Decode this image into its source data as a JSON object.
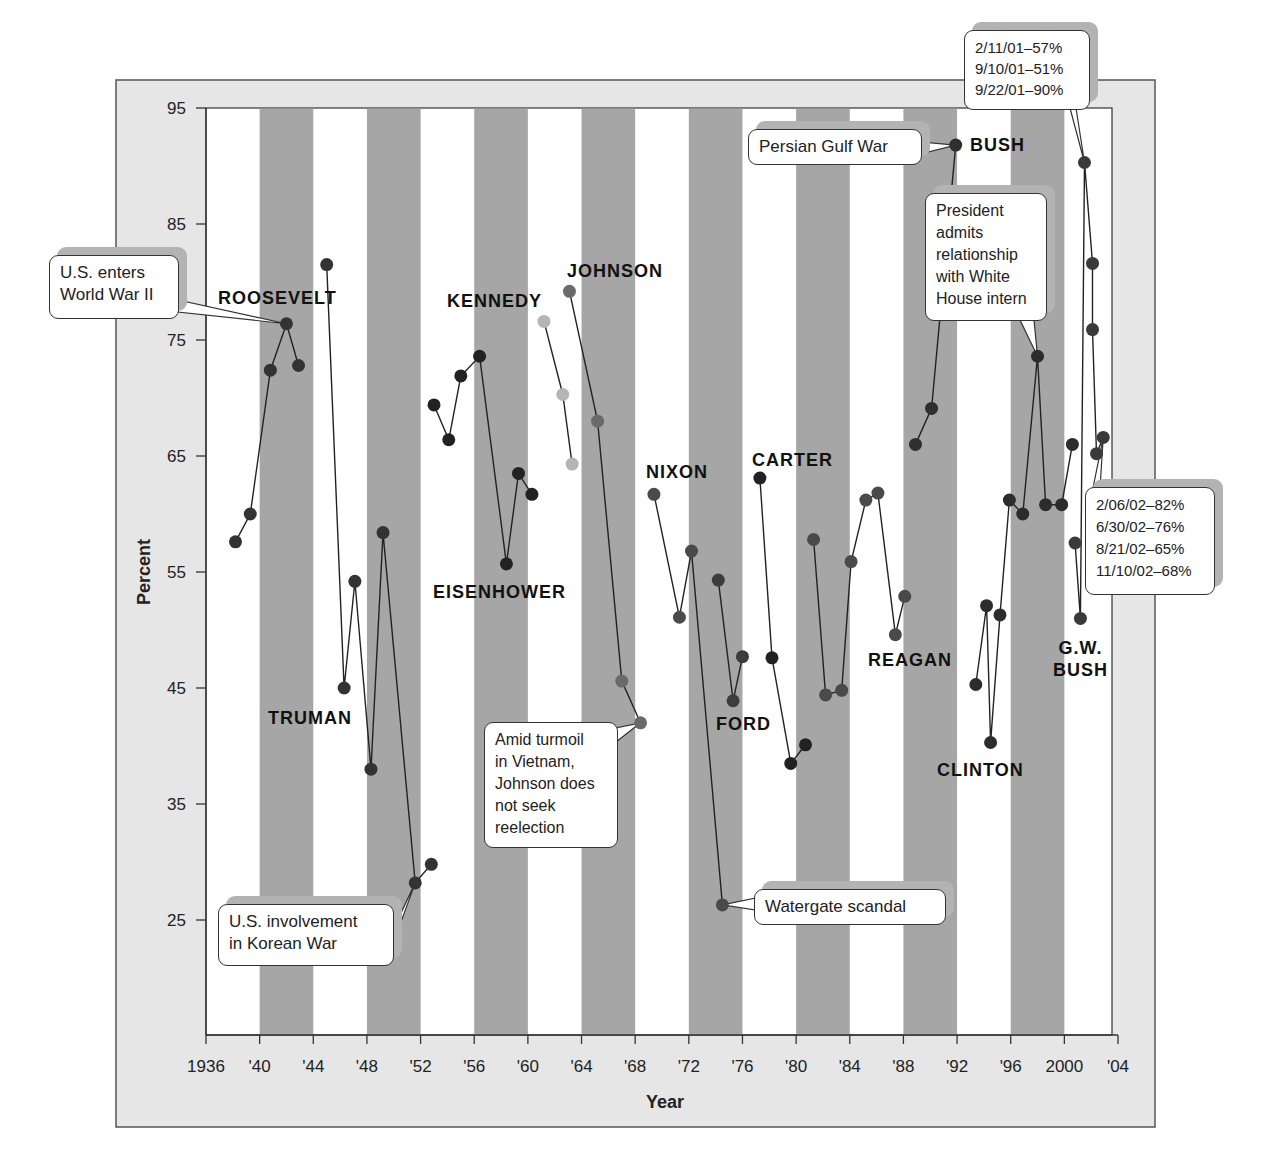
{
  "chart_data": {
    "type": "line",
    "title": "",
    "xlabel": "Year",
    "ylabel": "Percent",
    "xlim": [
      1936,
      2004
    ],
    "ylim": [
      15,
      95
    ],
    "x_ticks": [
      1936,
      1940,
      1944,
      1948,
      1952,
      1956,
      1960,
      1964,
      1968,
      1972,
      1976,
      1980,
      1984,
      1988,
      1992,
      1996,
      2000,
      2004
    ],
    "x_tick_labels": [
      "1936",
      "'40",
      "'44",
      "'48",
      "'52",
      "'56",
      "'60",
      "'64",
      "'68",
      "'72",
      "'76",
      "'80",
      "'84",
      "'88",
      "'92",
      "'96",
      "2000",
      "'04"
    ],
    "y_ticks": [
      25,
      35,
      45,
      55,
      65,
      75,
      85,
      95
    ],
    "y_tick_labels": [
      "25",
      "35",
      "45",
      "55",
      "65",
      "75",
      "85",
      "95"
    ],
    "grid": false,
    "shaded_bands": [
      [
        1940,
        1944
      ],
      [
        1948,
        1952
      ],
      [
        1956,
        1960
      ],
      [
        1964,
        1968
      ],
      [
        1972,
        1976
      ],
      [
        1980,
        1984
      ],
      [
        1988,
        1992
      ],
      [
        1996,
        2000
      ]
    ],
    "series": [
      {
        "name": "ROOSEVELT",
        "color": "#333333",
        "label_pos": [
          287,
          298
        ],
        "x": [
          1938.2,
          1939.3,
          1940.8,
          1942.0,
          1942.9
        ],
        "values": [
          57.6,
          60,
          72.4,
          76.4,
          72.8
        ]
      },
      {
        "name": "TRUMAN",
        "color": "#333333",
        "label_pos": [
          316,
          718
        ],
        "x": [
          1945.0,
          1946.3,
          1947.1,
          1948.3,
          1949.2,
          1951.6,
          1952.8
        ],
        "values": [
          81.5,
          45,
          54.2,
          38,
          58.4,
          28.2,
          29.8
        ]
      },
      {
        "name": "EISENHOWER",
        "color": "#222222",
        "label_pos": [
          508,
          592
        ],
        "x": [
          1953.0,
          1954.1,
          1955.0,
          1956.4,
          1958.4,
          1959.3,
          1960.3
        ],
        "values": [
          69.4,
          66.4,
          71.9,
          73.6,
          55.7,
          63.5,
          61.7
        ]
      },
      {
        "name": "KENNEDY",
        "color": "#b5b5b5",
        "label_pos": [
          500,
          301
        ],
        "x": [
          1961.2,
          1962.6,
          1963.3
        ],
        "values": [
          76.6,
          70.3,
          64.3
        ]
      },
      {
        "name": "JOHNSON",
        "color": "#6a6a6a",
        "label_pos": [
          622,
          271
        ],
        "x": [
          1963.1,
          1965.2,
          1967.0,
          1968.4
        ],
        "values": [
          79.2,
          68,
          45.6,
          42
        ]
      },
      {
        "name": "NIXON",
        "color": "#4a4a4a",
        "label_pos": [
          681,
          472
        ],
        "x": [
          1969.4,
          1971.3,
          1972.2,
          1974.5
        ],
        "values": [
          61.7,
          51.1,
          56.8,
          26.3
        ]
      },
      {
        "name": "FORD",
        "color": "#3c3c3c",
        "label_pos": [
          745,
          724
        ],
        "x": [
          1974.2,
          1975.3,
          1976.0
        ],
        "values": [
          54.3,
          43.9,
          47.7
        ]
      },
      {
        "name": "CARTER",
        "color": "#222222",
        "label_pos": [
          797,
          460
        ],
        "x": [
          1977.3,
          1978.2,
          1979.6,
          1980.7
        ],
        "values": [
          63.1,
          47.6,
          38.5,
          40.1
        ]
      },
      {
        "name": "REAGAN",
        "color": "#4a4a4a",
        "label_pos": [
          913,
          660
        ],
        "x": [
          1981.3,
          1982.2,
          1983.4,
          1984.1,
          1985.2,
          1986.1,
          1987.4,
          1988.1
        ],
        "values": [
          57.8,
          44.4,
          44.8,
          55.9,
          61.2,
          61.8,
          49.6,
          52.9
        ]
      },
      {
        "name": "BUSH",
        "color": "#2f2f2f",
        "label_pos": [
          1000,
          145
        ],
        "x": [
          1988.9,
          1990.1,
          1991.9
        ],
        "values": [
          66,
          69.1,
          91.8
        ]
      },
      {
        "name": "CLINTON",
        "color": "#2c2c2c",
        "label_pos": [
          983,
          770
        ],
        "x": [
          1993.4,
          1994.2,
          1994.5,
          1995.2,
          1995.9,
          1996.9,
          1998.0,
          1998.6,
          1999.8,
          2000.6
        ],
        "values": [
          45.3,
          52.1,
          40.3,
          51.3,
          61.2,
          60,
          73.6,
          60.8,
          60.8,
          66
        ]
      },
      {
        "name": "G.W. BUSH",
        "color": "#3a3a3a",
        "label_pos": [
          1085,
          648
        ],
        "x": [
          2000.8,
          2001.2,
          2001.5,
          2002.1,
          2002.1,
          2002.4,
          2002.9
        ],
        "values": [
          57.5,
          51,
          90.3,
          81.6,
          75.9,
          65.2,
          66.6
        ]
      }
    ],
    "annotations": [
      {
        "text": "U.S. enters\nWorld War II",
        "x": 1942.0,
        "y": 76.4
      },
      {
        "text": "U.S. involvement\nin Korean War",
        "x": 1951.6,
        "y": 28.2
      },
      {
        "text": "Amid turmoil\nin Vietnam,\nJohnson does\nnot seek\nreelection",
        "x": 1968.4,
        "y": 42
      },
      {
        "text": "Watergate scandal",
        "x": 1974.5,
        "y": 26.3
      },
      {
        "text": "Persian Gulf War",
        "x": 1991.9,
        "y": 91.8
      },
      {
        "text": "President\nadmits\nrelationship\nwith White\nHouse intern",
        "x": 1998.0,
        "y": 73.6
      },
      {
        "text": "2/11/01–57%\n9/10/01–51%\n9/22/01–90%",
        "x": 2001.5,
        "y": 90.3
      },
      {
        "text": "2/06/02–82%\n6/30/02–76%\n8/21/02–65%\n11/10/02–68%",
        "x": 2002.9,
        "y": 66.6
      }
    ]
  },
  "labels": {
    "xlabel": "Year",
    "ylabel": "Percent"
  },
  "presidents": {
    "roosevelt": "ROOSEVELT",
    "truman": "TRUMAN",
    "eisenhower": "EISENHOWER",
    "kennedy": "KENNEDY",
    "johnson": "JOHNSON",
    "nixon": "NIXON",
    "ford": "FORD",
    "carter": "CARTER",
    "reagan": "REAGAN",
    "bush": "BUSH",
    "clinton": "CLINTON",
    "gwbush": "G.W.\nBUSH"
  },
  "callouts": {
    "ww2": "U.S. enters\nWorld War II",
    "korea": "U.S. involvement\nin Korean War",
    "vietnam": "Amid turmoil\nin Vietnam,\nJohnson does\nnot seek\nreelection",
    "watergate": "Watergate scandal",
    "gulf": "Persian Gulf War",
    "intern": "President\nadmits\nrelationship\nwith White\nHouse intern",
    "bush2001": "2/11/01–57%\n9/10/01–51%\n9/22/01–90%",
    "bush2002": "2/06/02–82%\n6/30/02–76%\n8/21/02–65%\n11/10/02–68%"
  },
  "colors": {
    "panel": "#e6e6e6",
    "band": "#a6a6a6",
    "plot_bg": "#ffffff",
    "axis": "#333333"
  }
}
